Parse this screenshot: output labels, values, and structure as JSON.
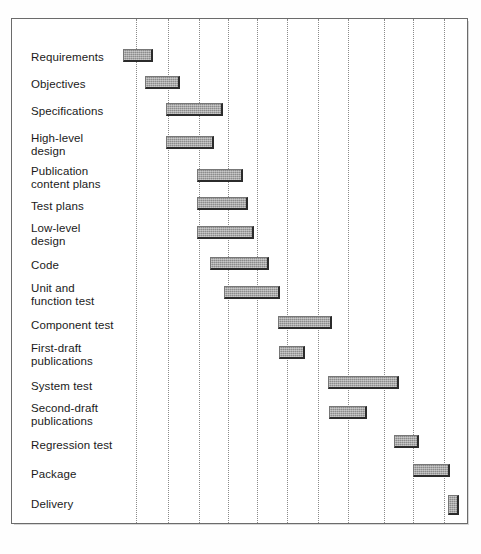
{
  "chart_data": {
    "type": "bar",
    "subtype": "gantt",
    "title": "",
    "xlabel": "",
    "ylabel": "",
    "orientation": "horizontal",
    "grid": "vertical-dotted",
    "legend": "none",
    "xlim": [
      0,
      11
    ],
    "gridline_units": [
      1,
      2,
      3,
      4,
      5,
      6,
      7,
      8,
      9,
      10,
      11
    ],
    "categories": [
      "Requirements",
      "Objectives",
      "Specifications",
      "High-level\ndesign",
      "Publication\ncontent plans",
      "Test plans",
      "Low-level\ndesign",
      "Code",
      "Unit and\nfunction test",
      "Component test",
      "First-draft\npublications",
      "System test",
      "Second-draft\npublications",
      "Regression test",
      "Package",
      "Delivery"
    ],
    "tasks": [
      {
        "name": "Requirements",
        "start": 0.0,
        "end": 0.95,
        "duration": 0.95
      },
      {
        "name": "Objectives",
        "start": 0.7,
        "end": 1.8,
        "duration": 1.1
      },
      {
        "name": "Specifications",
        "start": 1.4,
        "end": 3.2,
        "duration": 1.8
      },
      {
        "name": "High-level design",
        "start": 1.4,
        "end": 2.9,
        "duration": 1.5
      },
      {
        "name": "Publication content plans",
        "start": 2.4,
        "end": 3.85,
        "duration": 1.45
      },
      {
        "name": "Test plans",
        "start": 2.4,
        "end": 4.0,
        "duration": 1.6
      },
      {
        "name": "Low-level design",
        "start": 2.4,
        "end": 4.2,
        "duration": 1.8
      },
      {
        "name": "Code",
        "start": 2.8,
        "end": 4.7,
        "duration": 1.9
      },
      {
        "name": "Unit and function test",
        "start": 3.25,
        "end": 5.05,
        "duration": 1.8
      },
      {
        "name": "Component test",
        "start": 5.0,
        "end": 6.7,
        "duration": 1.7
      },
      {
        "name": "First-draft publications",
        "start": 5.05,
        "end": 5.85,
        "duration": 0.8
      },
      {
        "name": "System test",
        "start": 6.65,
        "end": 8.9,
        "duration": 2.25
      },
      {
        "name": "Second-draft publications",
        "start": 6.7,
        "end": 7.9,
        "duration": 1.2
      },
      {
        "name": "Regression test",
        "start": 8.8,
        "end": 9.6,
        "duration": 0.8
      },
      {
        "name": "Package",
        "start": 9.45,
        "end": 10.6,
        "duration": 1.15
      },
      {
        "name": "Delivery",
        "start": 10.55,
        "end": 10.9,
        "duration": 0.35
      }
    ],
    "colors": {
      "bar_fill": "#9c9c9c",
      "bar_shadow": "#2b2b2b",
      "gridline": "#8a8a8a",
      "frame": "#6b6b6b",
      "background": "#ffffff",
      "label_text": "#1a1a1a"
    }
  },
  "rows": [
    {
      "label": "Requirements",
      "label_top": 50,
      "bar_top": 48,
      "bar_left": 122,
      "bar_width": 30
    },
    {
      "label": "Objectives",
      "label_top": 77,
      "bar_top": 75,
      "bar_left": 144,
      "bar_width": 35
    },
    {
      "label": "Specifications",
      "label_top": 104,
      "bar_top": 102,
      "bar_left": 165,
      "bar_width": 57
    },
    {
      "label": "High-level\ndesign",
      "label_top": 131,
      "bar_top": 135,
      "bar_left": 165,
      "bar_width": 48
    },
    {
      "label": "Publication\ncontent plans",
      "label_top": 164,
      "bar_top": 168,
      "bar_left": 196,
      "bar_width": 46
    },
    {
      "label": "Test plans",
      "label_top": 199,
      "bar_top": 196,
      "bar_left": 196,
      "bar_width": 51
    },
    {
      "label": "Low-level\ndesign",
      "label_top": 221,
      "bar_top": 225,
      "bar_left": 196,
      "bar_width": 57
    },
    {
      "label": "Code",
      "label_top": 258,
      "bar_top": 256,
      "bar_left": 209,
      "bar_width": 59
    },
    {
      "label": "Unit and\nfunction test",
      "label_top": 281,
      "bar_top": 285,
      "bar_left": 223,
      "bar_width": 56
    },
    {
      "label": "Component test",
      "label_top": 318,
      "bar_top": 315,
      "bar_left": 277,
      "bar_width": 54
    },
    {
      "label": "First-draft\npublications",
      "label_top": 341,
      "bar_top": 345,
      "bar_left": 278,
      "bar_width": 26
    },
    {
      "label": "System test",
      "label_top": 379,
      "bar_top": 375,
      "bar_left": 327,
      "bar_width": 71
    },
    {
      "label": "Second-draft\npublications",
      "label_top": 401,
      "bar_top": 405,
      "bar_left": 328,
      "bar_width": 38
    },
    {
      "label": "Regression test",
      "label_top": 438,
      "bar_top": 434,
      "bar_left": 393,
      "bar_width": 25
    },
    {
      "label": "Package",
      "label_top": 467,
      "bar_top": 463,
      "bar_left": 412,
      "bar_width": 37
    },
    {
      "label": "Delivery",
      "label_top": 497,
      "bar_top": 494,
      "bar_left": 447,
      "bar_width": 11
    }
  ],
  "gridlines": [
    135,
    167,
    198,
    227,
    256,
    286,
    317,
    347,
    383,
    412,
    443
  ]
}
